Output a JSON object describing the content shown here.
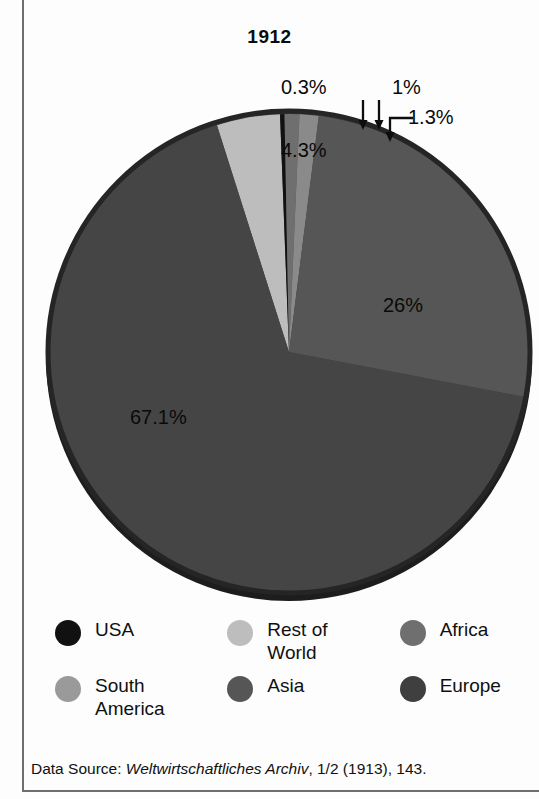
{
  "chart_data": {
    "type": "pie",
    "title": "1912",
    "xlabel": "",
    "ylabel": "",
    "legend_position": "bottom",
    "grid": false,
    "units": "percent",
    "categories": [
      "USA",
      "Rest of World",
      "Africa",
      "South America",
      "Asia",
      "Europe"
    ],
    "values": [
      0.3,
      4.3,
      1.0,
      1.3,
      26.0,
      67.1
    ],
    "slices": [
      {
        "label": "USA",
        "value": 0.3,
        "display": "0.3%",
        "color": "#111111",
        "callout": true
      },
      {
        "label": "Rest of World",
        "value": 4.3,
        "display": "4.3%",
        "color": "#bdbdbd",
        "callout": false
      },
      {
        "label": "Africa",
        "value": 1.0,
        "display": "1%",
        "color": "#6f6f6f",
        "callout": true
      },
      {
        "label": "South America",
        "value": 1.3,
        "display": "1.3%",
        "color": "#8a8a8a",
        "callout": true
      },
      {
        "label": "Asia",
        "value": 26.0,
        "display": "26%",
        "color": "#565656",
        "callout": false
      },
      {
        "label": "Europe",
        "value": 67.1,
        "display": "67.1%",
        "color": "#454545",
        "callout": false
      }
    ],
    "data_labels": [
      "0.3%",
      "1%",
      "1.3%",
      "4.3%",
      "26%",
      "67.1%"
    ],
    "source_note": "Data Source: Weltwirtschaftliches Archiv, 1/2 (1913), 143."
  },
  "header": {
    "title": "1912"
  },
  "labels": {
    "usa_pct": "0.3%",
    "africa_pct": "1%",
    "south_america_pct": "1.3%",
    "rest_of_world_pct": "4.3%",
    "asia_pct": "26%",
    "europe_pct": "67.1%"
  },
  "legend": {
    "items": [
      {
        "label": "USA",
        "color": "#111111"
      },
      {
        "label": "Rest of World",
        "color": "#bdbdbd"
      },
      {
        "label": "Africa",
        "color": "#6f6f6f"
      },
      {
        "label": "South America",
        "color": "#9a9a9a"
      },
      {
        "label": "Asia",
        "color": "#565656"
      },
      {
        "label": "Europe",
        "color": "#3f3f3f"
      }
    ]
  },
  "source": {
    "prefix": "Data Source: ",
    "journal": "Weltwirtschaftliches Archiv",
    "suffix": ", 1/2 (1913), 143."
  },
  "colors": {
    "frame": "#6e6e6e",
    "background": "#fdfdfd",
    "text": "#0a0a0a",
    "pie_rim": "#1d1d1d"
  }
}
